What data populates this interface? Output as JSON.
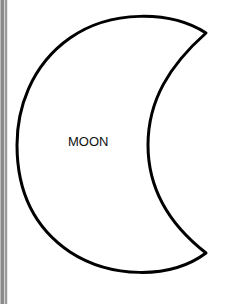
{
  "shape": {
    "name": "crescent-moon",
    "stroke_color": "#000000",
    "fill_color": "#ffffff"
  },
  "label": "MOON"
}
